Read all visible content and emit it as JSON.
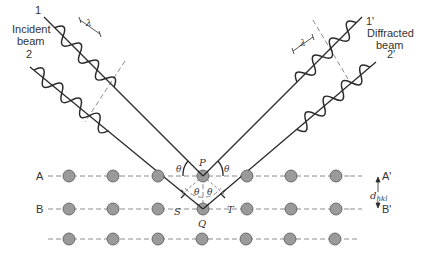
{
  "diagram": {
    "incident": {
      "beam1_label": "1",
      "beam2_label": "2",
      "text_line1": "Incident",
      "text_line2": "beam",
      "wavelength_symbol": "λ"
    },
    "diffracted": {
      "beam1_label": "1'",
      "beam2_label": "2'",
      "text_line1": "Diffracted",
      "text_line2": "beam",
      "wavelength_symbol": "λ"
    },
    "points": {
      "P": "P",
      "Q": "Q",
      "S": "S",
      "T": "T"
    },
    "angle_symbol": "θ",
    "planes": {
      "A": "A",
      "A_prime": "A'",
      "B": "B",
      "B_prime": "B'"
    },
    "spacing_label": {
      "d": "d",
      "subscript": "hkl"
    },
    "colors": {
      "line": "#2a2a2a",
      "atom_fill": "#9a9a9a",
      "atom_stroke": "#555555",
      "dashed": "#888888"
    }
  }
}
